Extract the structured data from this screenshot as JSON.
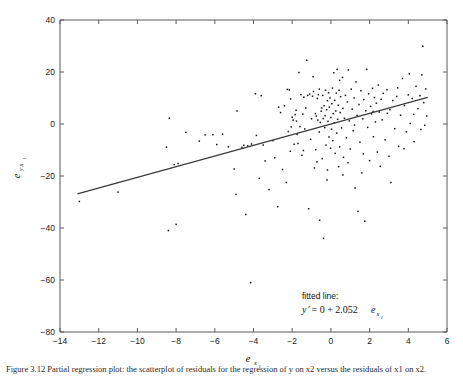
{
  "figure": {
    "background_color": "#ffffff",
    "axis_color": "#5a5a5a",
    "point_color": "#141414",
    "line_color": "#3a3a3a"
  },
  "annotation": {
    "head": "fitted line:",
    "eq_y": "y",
    "eq_prime": "′",
    "eq_mid": " = 0 + 2.052",
    "eq_e": "e",
    "eq_sub": "x",
    "eq_sub2": "1"
  },
  "axis_titles": {
    "x_main": "e",
    "x_sub": "x",
    "x_sub2": "1",
    "y_main": "e",
    "y_sub": "y·x",
    "y_sub2": "1"
  },
  "caption": {
    "text": "Figure 3.12  Partial regression plot: the scatterplot of residuals for the regression of y on x2 versus the residuals of x1 on x2."
  },
  "chart_data": {
    "type": "scatter",
    "title": "",
    "xlabel": "e_x1",
    "ylabel": "e_y·x1",
    "xlim": [
      -14,
      6
    ],
    "ylim": [
      -80,
      40
    ],
    "xticks": [
      -14,
      -12,
      -10,
      -8,
      -6,
      -4,
      -2,
      0,
      2,
      4,
      6
    ],
    "xticklabels": [
      "-14",
      "-12",
      "-10",
      "-8",
      "-6",
      "-4",
      "-2",
      "0",
      "2",
      "4",
      "6"
    ],
    "yticks": [
      -80,
      -60,
      -40,
      -20,
      0,
      20,
      40
    ],
    "yticklabels": [
      "-80",
      "-60",
      "-40",
      "-20",
      "0",
      "20",
      "40"
    ],
    "grid": false,
    "legend": null,
    "marker_size": 1.5,
    "fit_line": {
      "slope": 2.052,
      "intercept": 0,
      "x_start": -13.1,
      "x_end": 5.0,
      "label": "y' = 0 + 2.052e_x1"
    },
    "points": [
      [
        -13.0,
        -29.8
      ],
      [
        -11.0,
        -26.2
      ],
      [
        -8.5,
        -8.9
      ],
      [
        -8.4,
        -41.0
      ],
      [
        -8.35,
        2.2
      ],
      [
        -8.1,
        -15.6
      ],
      [
        -8.0,
        -38.6
      ],
      [
        -7.9,
        -15.2
      ],
      [
        -7.5,
        -3.2
      ],
      [
        -6.8,
        -6.6
      ],
      [
        -6.5,
        -4.2
      ],
      [
        -6.1,
        -4.1
      ],
      [
        -5.9,
        -7.9
      ],
      [
        -5.6,
        -3.9
      ],
      [
        -5.3,
        -8.8
      ],
      [
        -5.0,
        -17.3
      ],
      [
        -4.9,
        -27.1
      ],
      [
        -4.85,
        5.0
      ],
      [
        -4.6,
        -9.0
      ],
      [
        -4.5,
        -8.2
      ],
      [
        -4.4,
        -34.8
      ],
      [
        -4.3,
        -8.4
      ],
      [
        -4.15,
        -61.0
      ],
      [
        -4.1,
        -7.7
      ],
      [
        -3.9,
        11.6
      ],
      [
        -3.85,
        -4.4
      ],
      [
        -3.7,
        -20.9
      ],
      [
        -3.6,
        10.9
      ],
      [
        -3.5,
        -8.1
      ],
      [
        -3.4,
        -14.2
      ],
      [
        -3.2,
        -25.2
      ],
      [
        -3.0,
        -6.4
      ],
      [
        -2.9,
        -13.0
      ],
      [
        -2.75,
        -31.8
      ],
      [
        -2.7,
        6.5
      ],
      [
        -2.6,
        4.4
      ],
      [
        -2.5,
        -17.5
      ],
      [
        -2.4,
        7.0
      ],
      [
        -2.3,
        -22.5
      ],
      [
        -2.25,
        13.3
      ],
      [
        -2.2,
        -2.9
      ],
      [
        -2.15,
        13.1
      ],
      [
        -2.1,
        -10.5
      ],
      [
        -2.05,
        -1.1
      ],
      [
        -2.0,
        2.6
      ],
      [
        -1.95,
        1.5
      ],
      [
        -1.9,
        -7.8
      ],
      [
        -1.85,
        3.6
      ],
      [
        -1.8,
        5.3
      ],
      [
        -1.75,
        -4.0
      ],
      [
        -1.7,
        -7.5
      ],
      [
        -1.65,
        19.8
      ],
      [
        -1.6,
        -1.0
      ],
      [
        -1.55,
        11.3
      ],
      [
        -1.5,
        -12.0
      ],
      [
        -1.45,
        3.8
      ],
      [
        -1.4,
        10.3
      ],
      [
        -1.35,
        -1.9
      ],
      [
        -1.3,
        6.2
      ],
      [
        -1.25,
        24.5
      ],
      [
        -1.2,
        11.0
      ],
      [
        -1.15,
        -32.6
      ],
      [
        -1.1,
        11.5
      ],
      [
        -1.05,
        -5.9
      ],
      [
        -1.0,
        2.0
      ],
      [
        -0.95,
        10.7
      ],
      [
        -0.9,
        12.5
      ],
      [
        -0.85,
        -16.9
      ],
      [
        -0.8,
        4.0
      ],
      [
        -0.78,
        -9.9
      ],
      [
        -0.75,
        3.0
      ],
      [
        -0.72,
        -14.6
      ],
      [
        -0.7,
        9.8
      ],
      [
        -0.68,
        1.5
      ],
      [
        -0.65,
        11.3
      ],
      [
        -0.6,
        -3.1
      ],
      [
        -0.58,
        -37.0
      ],
      [
        -0.55,
        0.6
      ],
      [
        -0.5,
        4.9
      ],
      [
        -0.48,
        6.2
      ],
      [
        -0.45,
        -13.3
      ],
      [
        -0.42,
        11.0
      ],
      [
        -0.4,
        2.1
      ],
      [
        -0.38,
        -44.0
      ],
      [
        -0.35,
        7.0
      ],
      [
        -0.32,
        -1.4
      ],
      [
        -0.3,
        3.2
      ],
      [
        -0.28,
        13.0
      ],
      [
        -0.25,
        -8.1
      ],
      [
        -0.22,
        5.5
      ],
      [
        -0.2,
        -21.5
      ],
      [
        -0.18,
        9.0
      ],
      [
        -0.15,
        1.0
      ],
      [
        -0.12,
        12.0
      ],
      [
        -0.1,
        -5.0
      ],
      [
        -0.08,
        6.5
      ],
      [
        -0.05,
        10.0
      ],
      [
        -0.02,
        -9.3
      ],
      [
        0.0,
        2.5
      ],
      [
        0.03,
        -2.0
      ],
      [
        0.05,
        7.8
      ],
      [
        0.08,
        13.8
      ],
      [
        0.1,
        -6.4
      ],
      [
        0.12,
        4.0
      ],
      [
        0.15,
        19.7
      ],
      [
        0.18,
        0.5
      ],
      [
        0.2,
        9.1
      ],
      [
        0.22,
        -11.3
      ],
      [
        0.25,
        5.0
      ],
      [
        0.28,
        11.9
      ],
      [
        0.3,
        -3.5
      ],
      [
        0.32,
        21.0
      ],
      [
        0.35,
        1.8
      ],
      [
        0.38,
        7.2
      ],
      [
        0.4,
        -16.4
      ],
      [
        0.42,
        13.0
      ],
      [
        0.45,
        -8.8
      ],
      [
        0.48,
        4.4
      ],
      [
        0.5,
        10.5
      ],
      [
        0.55,
        -1.5
      ],
      [
        0.6,
        17.9
      ],
      [
        0.62,
        6.0
      ],
      [
        0.65,
        -12.8
      ],
      [
        0.7,
        2.2
      ],
      [
        0.75,
        11.0
      ],
      [
        0.8,
        -5.3
      ],
      [
        0.85,
        8.5
      ],
      [
        0.9,
        20.8
      ],
      [
        0.95,
        1.2
      ],
      [
        1.0,
        -9.6
      ],
      [
        1.05,
        13.4
      ],
      [
        1.1,
        5.7
      ],
      [
        1.15,
        -2.6
      ],
      [
        1.2,
        10.0
      ],
      [
        1.25,
        -24.6
      ],
      [
        1.3,
        16.2
      ],
      [
        1.35,
        3.3
      ],
      [
        1.4,
        -33.6
      ],
      [
        1.45,
        7.5
      ],
      [
        1.5,
        -7.0
      ],
      [
        1.55,
        12.8
      ],
      [
        1.6,
        -18.8
      ],
      [
        1.65,
        2.0
      ],
      [
        1.7,
        9.4
      ],
      [
        1.75,
        -37.4
      ],
      [
        1.8,
        5.1
      ],
      [
        1.85,
        21.0
      ],
      [
        1.9,
        -1.3
      ],
      [
        1.95,
        11.6
      ],
      [
        2.0,
        -14.1
      ],
      [
        2.05,
        6.8
      ],
      [
        2.1,
        3.9
      ],
      [
        2.15,
        13.7
      ],
      [
        2.2,
        -4.9
      ],
      [
        2.25,
        10.2
      ],
      [
        2.3,
        0.8
      ],
      [
        2.35,
        8.0
      ],
      [
        2.4,
        -10.8
      ],
      [
        2.45,
        15.0
      ],
      [
        2.5,
        4.6
      ],
      [
        2.55,
        -16.3
      ],
      [
        2.6,
        9.5
      ],
      [
        2.65,
        1.6
      ],
      [
        2.7,
        11.8
      ],
      [
        2.8,
        -6.1
      ],
      [
        2.9,
        13.2
      ],
      [
        3.0,
        -12.4
      ],
      [
        3.05,
        5.5
      ],
      [
        3.1,
        -22.5
      ],
      [
        3.2,
        9.0
      ],
      [
        3.3,
        -1.8
      ],
      [
        3.4,
        10.6
      ],
      [
        3.5,
        -8.6
      ],
      [
        3.6,
        3.4
      ],
      [
        3.7,
        17.5
      ],
      [
        3.8,
        7.1
      ],
      [
        3.9,
        -3.0
      ],
      [
        4.0,
        11.2
      ],
      [
        4.05,
        19.3
      ],
      [
        4.1,
        0.2
      ],
      [
        4.2,
        9.8
      ],
      [
        4.3,
        -6.8
      ],
      [
        4.4,
        14.5
      ],
      [
        4.5,
        5.9
      ],
      [
        4.6,
        10.9
      ],
      [
        4.65,
        -2.1
      ],
      [
        4.7,
        18.9
      ],
      [
        4.75,
        29.9
      ],
      [
        4.8,
        8.2
      ],
      [
        4.85,
        -0.5
      ],
      [
        4.9,
        13.5
      ],
      [
        4.95,
        3.1
      ],
      [
        -0.6,
        13.4
      ],
      [
        0.45,
        16.8
      ],
      [
        1.22,
        -0.4
      ],
      [
        2.18,
        4.8
      ],
      [
        -1.42,
        -10.2
      ],
      [
        0.88,
        -14.9
      ],
      [
        3.45,
        13.9
      ],
      [
        -2.08,
        9.6
      ],
      [
        1.68,
        -11.5
      ],
      [
        -0.18,
        -17.7
      ],
      [
        2.92,
        4.1
      ],
      [
        4.28,
        3.7
      ],
      [
        -1.78,
        1.1
      ],
      [
        0.62,
        -19.6
      ],
      [
        3.78,
        -9.5
      ],
      [
        -0.92,
        18.2
      ]
    ]
  }
}
